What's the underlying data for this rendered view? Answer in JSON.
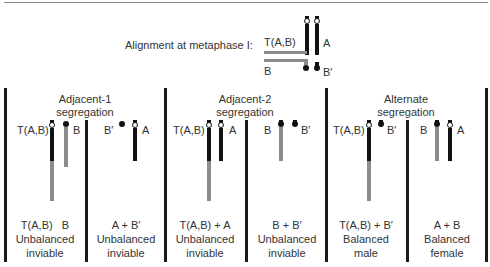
{
  "top_rule": true,
  "metaphase": {
    "label": "Alignment at metaphase I:",
    "chromosomes": {
      "translocation": "T(A,B)",
      "a": "A",
      "b": "B",
      "b_prime": "B′"
    }
  },
  "panels": [
    {
      "title_line1": "Adjacent-1",
      "title_line2": "segregation",
      "gametes": [
        {
          "chromosome_labels": [
            "T(A,B)",
            "B"
          ],
          "result_line1": "T(A,B)   B",
          "result_line2": "Unbalanced",
          "result_line3": "inviable"
        },
        {
          "chromosome_labels": [
            "B′",
            "A"
          ],
          "result_line1": "A + B′",
          "result_line2": "Unbalanced",
          "result_line3": "inviable"
        }
      ]
    },
    {
      "title_line1": "Adjacent-2",
      "title_line2": "segregation",
      "gametes": [
        {
          "chromosome_labels": [
            "T(A,B)",
            "A"
          ],
          "result_line1": "T(A,B) + A",
          "result_line2": "Unbalanced",
          "result_line3": "inviable"
        },
        {
          "chromosome_labels": [
            "B",
            "B′"
          ],
          "result_line1": "B + B′",
          "result_line2": "Unbalanced",
          "result_line3": "inviable"
        }
      ]
    },
    {
      "title_line1": "Alternate",
      "title_line2": "segregation",
      "gametes": [
        {
          "chromosome_labels": [
            "T(A,B)",
            "B′"
          ],
          "result_line1": "T(A,B) + B′",
          "result_line2": "Balanced",
          "result_line3": "male"
        },
        {
          "chromosome_labels": [
            "B",
            "A"
          ],
          "result_line1": "A + B",
          "result_line2": "Balanced",
          "result_line3": "female"
        }
      ]
    }
  ],
  "colors": {
    "chromosome_A_segment": "#111111",
    "chromosome_B_segment": "#8c8c8c",
    "divider": "#1a1a1a",
    "text": "#333333"
  }
}
